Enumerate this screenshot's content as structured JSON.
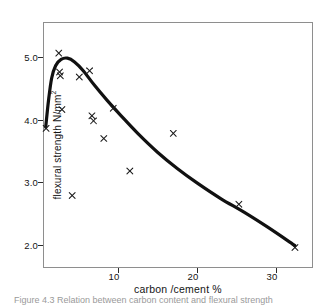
{
  "figure": {
    "caption": "Figure 4.3   Relation between carbon content and flexural strength"
  },
  "axes": {
    "y_title": "flexural strength N/mm",
    "y_title_sup": "2",
    "x_title": "carbon /cement %",
    "y_ticks": [
      "2.0",
      "3.0",
      "4.0",
      "5.0"
    ],
    "x_ticks": [
      "10",
      "20",
      "30"
    ]
  },
  "chart_data": {
    "type": "scatter",
    "title": "",
    "xlabel": "carbon /cement %",
    "ylabel": "flexural strength N/mm2",
    "xlim": [
      0,
      34
    ],
    "ylim": [
      1.6,
      5.45
    ],
    "grid": false,
    "legend": "none",
    "xticks": [
      10,
      20,
      30
    ],
    "yticks": [
      2.0,
      3.0,
      4.0,
      5.0
    ],
    "marker": "x",
    "series": [
      {
        "name": "measured",
        "type": "scatter",
        "points": [
          {
            "x": 0.9,
            "y": 3.86
          },
          {
            "x": 2.5,
            "y": 5.06
          },
          {
            "x": 2.6,
            "y": 4.76
          },
          {
            "x": 2.7,
            "y": 4.7
          },
          {
            "x": 2.9,
            "y": 4.16
          },
          {
            "x": 4.2,
            "y": 2.79
          },
          {
            "x": 5.1,
            "y": 4.68
          },
          {
            "x": 6.4,
            "y": 4.78
          },
          {
            "x": 6.7,
            "y": 4.06
          },
          {
            "x": 6.9,
            "y": 3.98
          },
          {
            "x": 8.2,
            "y": 3.7
          },
          {
            "x": 9.4,
            "y": 4.18
          },
          {
            "x": 11.5,
            "y": 3.18
          },
          {
            "x": 17.0,
            "y": 3.78
          },
          {
            "x": 25.3,
            "y": 2.65
          },
          {
            "x": 32.4,
            "y": 1.96
          }
        ]
      },
      {
        "name": "fitted curve",
        "type": "line",
        "points": [
          {
            "x": 0.85,
            "y": 3.88
          },
          {
            "x": 1.2,
            "y": 4.3
          },
          {
            "x": 1.6,
            "y": 4.66
          },
          {
            "x": 2.1,
            "y": 4.86
          },
          {
            "x": 2.8,
            "y": 4.96
          },
          {
            "x": 3.6,
            "y": 4.98
          },
          {
            "x": 4.5,
            "y": 4.92
          },
          {
            "x": 5.6,
            "y": 4.78
          },
          {
            "x": 7.0,
            "y": 4.55
          },
          {
            "x": 8.6,
            "y": 4.31
          },
          {
            "x": 10.4,
            "y": 4.06
          },
          {
            "x": 12.5,
            "y": 3.78
          },
          {
            "x": 15.0,
            "y": 3.48
          },
          {
            "x": 17.5,
            "y": 3.22
          },
          {
            "x": 20.0,
            "y": 2.99
          },
          {
            "x": 23.0,
            "y": 2.74
          },
          {
            "x": 26.0,
            "y": 2.52
          },
          {
            "x": 29.0,
            "y": 2.28
          },
          {
            "x": 32.4,
            "y": 1.99
          }
        ]
      }
    ]
  }
}
